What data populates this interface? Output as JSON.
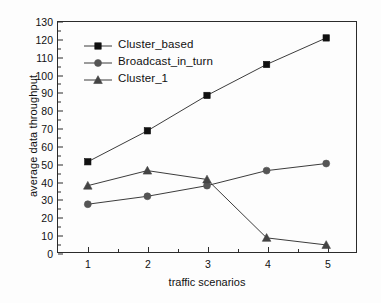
{
  "chart_data": {
    "type": "line",
    "title": "",
    "xlabel": "traffic scenarios",
    "ylabel": "average data throughput",
    "categories": [
      "1",
      "2",
      "3",
      "4",
      "5"
    ],
    "x": [
      1,
      2,
      3,
      4,
      5
    ],
    "xlim": [
      0.5,
      5.5
    ],
    "ylim": [
      0,
      130
    ],
    "y_ticks": [
      0,
      10,
      20,
      30,
      40,
      50,
      60,
      70,
      80,
      90,
      100,
      110,
      120,
      130
    ],
    "x_ticks": [
      1,
      2,
      3,
      4,
      5
    ],
    "grid": false,
    "legend_position": "upper left inside",
    "series": [
      {
        "name": "Cluster_based",
        "marker": "square",
        "color": "#101010",
        "values": [
          51,
          68.5,
          88.5,
          106,
          121
        ]
      },
      {
        "name": "Broadcast_in_turn",
        "marker": "circle",
        "color": "#555555",
        "values": [
          27,
          31.5,
          37.5,
          46,
          50
        ]
      },
      {
        "name": "Cluster_1",
        "marker": "triangle",
        "color": "#444444",
        "values": [
          37.5,
          46,
          41,
          8,
          4
        ]
      }
    ],
    "colors": {
      "axis": "#2b2b2b",
      "background": "#fdfdfd",
      "line": "#3a3a3a"
    }
  }
}
